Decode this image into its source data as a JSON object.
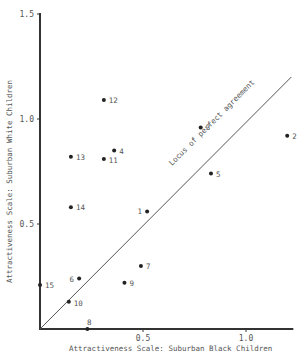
{
  "chart_data": {
    "type": "scatter",
    "title": "",
    "xlabel": "Attractiveness Scale:  Suburban Black Children",
    "ylabel": "Attractiveness Scale:  Suburban White Children",
    "xlim": [
      0,
      1.22
    ],
    "ylim": [
      0,
      1.5
    ],
    "x_ticks": [
      "0.5",
      "1.0"
    ],
    "y_ticks": [
      "0.5",
      "1.0",
      "1.5"
    ],
    "grid": false,
    "reference_line": {
      "label": "Locus of perfect agreement",
      "from": [
        0,
        0
      ],
      "to": [
        1.22,
        1.2
      ]
    },
    "points": [
      {
        "label": "1",
        "x": 0.52,
        "y": 0.56
      },
      {
        "label": "2",
        "x": 1.2,
        "y": 0.92
      },
      {
        "label": "3",
        "x": 0.78,
        "y": 0.96
      },
      {
        "label": "4",
        "x": 0.36,
        "y": 0.85
      },
      {
        "label": "5",
        "x": 0.83,
        "y": 0.74
      },
      {
        "label": "6",
        "x": 0.19,
        "y": 0.24
      },
      {
        "label": "7",
        "x": 0.49,
        "y": 0.3
      },
      {
        "label": "8",
        "x": 0.23,
        "y": 0.0
      },
      {
        "label": "9",
        "x": 0.41,
        "y": 0.22
      },
      {
        "label": "10",
        "x": 0.14,
        "y": 0.13
      },
      {
        "label": "11",
        "x": 0.31,
        "y": 0.81
      },
      {
        "label": "12",
        "x": 0.31,
        "y": 1.09
      },
      {
        "label": "13",
        "x": 0.15,
        "y": 0.82
      },
      {
        "label": "14",
        "x": 0.15,
        "y": 0.58
      },
      {
        "label": "15",
        "x": 0.0,
        "y": 0.21
      }
    ]
  }
}
